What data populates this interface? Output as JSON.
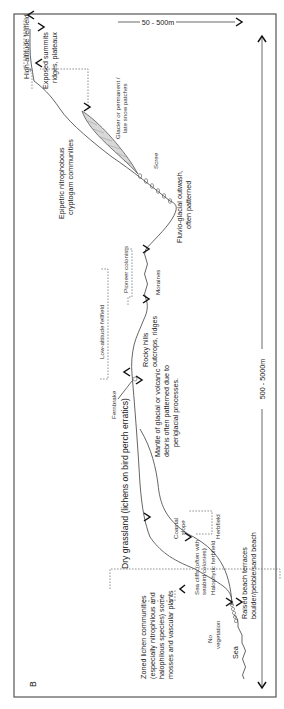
{
  "figure": {
    "panel_label": "B",
    "scale_main": "500 - 5000m",
    "scale_top": "50 - 500m"
  },
  "zones": {
    "sea": "Sea",
    "no_vegetation": [
      "No",
      "vegetation"
    ],
    "raised_beach": [
      "Raised beach terraces",
      "boulder/pebble/sand beach"
    ],
    "zoned_lichen": [
      "Zoned lichen communities",
      "(especially nitrophilous and",
      "halophilous species) some",
      "mosses and vascular plants"
    ],
    "sea_cliffs": [
      "Sea cliffs (often with",
      "seabird colonies)"
    ],
    "halophytic": "Halophytic herbfield",
    "coastal_slope": [
      "Coastal",
      "slope"
    ],
    "herbfield": "Herbfield",
    "dry_grassland": "Dry grassland (lichens on bird perch erratics)",
    "mantle": [
      "Mantle of glacial or volcanic",
      "debris often patterned due to",
      "periglacial processes."
    ],
    "fernbrake": "Fernbrake",
    "rocky_hills": [
      "Rocky hills",
      "outcrops, ridges"
    ],
    "low_fellfield": "Low-altitude fellfield",
    "pioneer": "Pioneer colonists",
    "moraines": "Moraines",
    "fluvio": [
      "Fluvio-glacial outwash,",
      "often patterned"
    ],
    "scree": "Scree",
    "glacier": [
      "Glacier or permanent /",
      "late snow patches"
    ],
    "epipetric": [
      "Epipetric nitrophobous",
      "cryptogam communities"
    ],
    "exposed_summits": [
      "Exposed summits",
      "ridges, plateaux"
    ],
    "high_fellfield": "High-altitude fellfield"
  }
}
